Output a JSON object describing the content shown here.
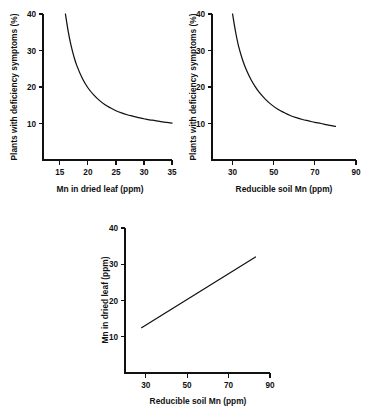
{
  "figure": {
    "background_color": "#ffffff",
    "ink_color": "#111111",
    "panel_count": 3
  },
  "chart_data": [
    {
      "id": "panel-a",
      "type": "line",
      "title": "",
      "xlabel": "Mn in dried leaf (ppm)",
      "ylabel": "Plants with deficiency symptoms (%)",
      "xlim": [
        12,
        35
      ],
      "ylim": [
        0,
        40
      ],
      "xticks": [
        15,
        20,
        25,
        30,
        35
      ],
      "yticks": [
        10,
        20,
        30,
        40
      ],
      "grid": false,
      "legend": "none",
      "series": [
        {
          "name": "deficiency vs leaf Mn",
          "x": [
            16.0,
            16.5,
            17.0,
            17.5,
            18.0,
            19.0,
            20.0,
            21.0,
            22.0,
            23.0,
            24.0,
            25.0,
            26.0,
            27.0,
            28.0,
            29.0,
            30.0,
            31.0,
            32.0,
            33.0,
            34.0,
            35.0
          ],
          "y": [
            40.0,
            35.2,
            31.4,
            28.4,
            26.0,
            22.4,
            19.8,
            17.9,
            16.4,
            15.2,
            14.3,
            13.5,
            12.9,
            12.4,
            12.0,
            11.6,
            11.3,
            11.0,
            10.8,
            10.5,
            10.3,
            10.1
          ]
        }
      ]
    },
    {
      "id": "panel-b",
      "type": "line",
      "title": "",
      "xlabel": "Reducible soil Mn (ppm)",
      "ylabel": "Plants with deficiency symptoms (%)",
      "xlim": [
        20,
        90
      ],
      "ylim": [
        0,
        40
      ],
      "xticks": [
        30,
        50,
        70,
        90
      ],
      "yticks": [
        10,
        20,
        30,
        40
      ],
      "grid": false,
      "legend": "none",
      "series": [
        {
          "name": "deficiency vs reducible soil Mn",
          "x": [
            30.0,
            31.5,
            33.0,
            35.0,
            37.0,
            39.0,
            41.0,
            43.0,
            46.0,
            49.0,
            52.0,
            55.0,
            58.0,
            61.0,
            64.0,
            67.0,
            70.0,
            73.0,
            76.0,
            80.0
          ],
          "y": [
            40.0,
            35.0,
            31.0,
            27.2,
            24.3,
            22.0,
            20.1,
            18.5,
            16.6,
            15.1,
            13.9,
            13.0,
            12.2,
            11.6,
            11.1,
            10.7,
            10.3,
            10.0,
            9.6,
            9.2
          ]
        }
      ]
    },
    {
      "id": "panel-c",
      "type": "line",
      "title": "",
      "xlabel": "Reducible soil Mn (ppm)",
      "ylabel": "Mn in dried leaf (ppm)",
      "xlim": [
        20,
        90
      ],
      "ylim": [
        0,
        40
      ],
      "xticks": [
        30,
        50,
        70,
        90
      ],
      "yticks": [
        10,
        20,
        30,
        40
      ],
      "grid": false,
      "legend": "none",
      "series": [
        {
          "name": "leaf Mn vs reducible soil Mn",
          "x": [
            28.0,
            83.0
          ],
          "y": [
            12.5,
            32.0
          ]
        }
      ]
    }
  ],
  "panel_a": {
    "xlabel": "Mn in dried leaf (ppm)",
    "ylabel": "Plants with deficiency symptoms (%)",
    "xticklabels": [
      "15",
      "20",
      "25",
      "30",
      "35"
    ],
    "yticklabels": [
      "10",
      "20",
      "30",
      "40"
    ]
  },
  "panel_b": {
    "xlabel": "Reducible soil Mn (ppm)",
    "ylabel": "Plants with deficiency symptoms (%)",
    "xticklabels": [
      "30",
      "50",
      "70",
      "90"
    ],
    "yticklabels": [
      "10",
      "20",
      "30",
      "40"
    ]
  },
  "panel_c": {
    "xlabel": "Reducible soil Mn (ppm)",
    "ylabel": "Mn in dried leaf (ppm)",
    "xticklabels": [
      "30",
      "50",
      "70",
      "90"
    ],
    "yticklabels": [
      "10",
      "20",
      "30",
      "40"
    ]
  }
}
